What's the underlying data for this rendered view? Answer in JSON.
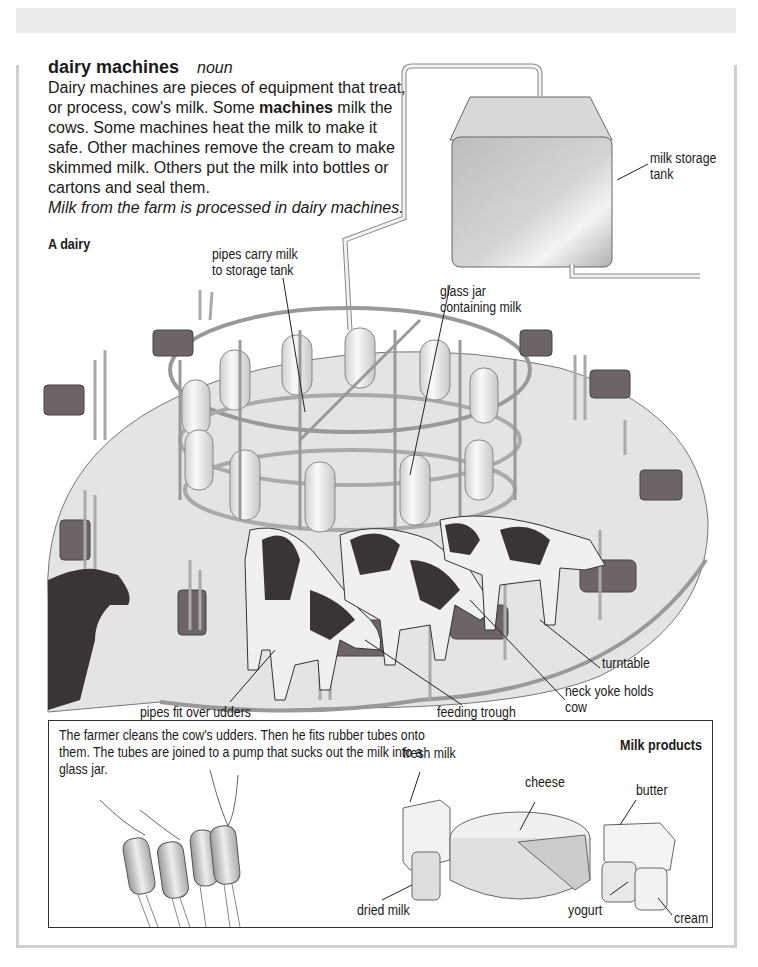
{
  "entry": {
    "headword": "dairy machines",
    "part_of_speech": "noun",
    "definition_part1": "Dairy machines are pieces of equipment that treat, or process, cow's milk. Some ",
    "definition_bold": "machines",
    "definition_part2": " milk the cows. Some machines heat the milk to make it safe. Other machines remove the cream to make skimmed milk. Others put the milk into bottles or cartons and seal them.",
    "example": "Milk from the farm is processed in dairy machines."
  },
  "illustration": {
    "title": "A dairy",
    "labels": {
      "pipes_carry": "pipes carry milk\nto storage tank",
      "storage_tank": "milk storage\ntank",
      "glass_jar": "glass jar\ncontaining milk",
      "turntable": "turntable",
      "neck_yoke": "neck yoke holds\ncow",
      "feeding_trough": "feeding trough",
      "pipes_fit": "pipes fit over udders"
    }
  },
  "milking_box": {
    "text": "The farmer cleans the cow's udders. Then he fits rubber tubes onto them. The tubes are joined to a pump that sucks out the milk into a glass jar."
  },
  "milk_products": {
    "title": "Milk products",
    "items": [
      "fresh milk",
      "cheese",
      "butter",
      "dried milk",
      "yogurt",
      "cream"
    ]
  },
  "colors": {
    "frame": "#cfcfcf",
    "top_band": "#ececec",
    "text": "#1a1a1a",
    "cow_dark": "#3a3436",
    "turntable": "#e6e6e6",
    "trough": "#6e6466"
  }
}
